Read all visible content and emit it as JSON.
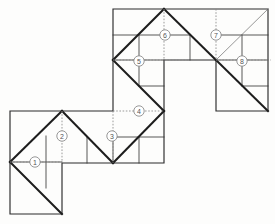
{
  "diagram": {
    "canvas": {
      "width": 275,
      "height": 224
    },
    "background_color": "#fdfdfc",
    "line_colors": {
      "outline": "#2b2b2b",
      "bold_diagonal": "#1d1d1d",
      "thin_grid": "#3a3a3a",
      "hairline": "#6a6a6a",
      "construction_dotted": "#8a8a8a",
      "marker_stroke": "#7d7d7d",
      "marker_text": "#555555"
    },
    "markers": [
      {
        "id": "1",
        "label": "1",
        "x": 35,
        "y": 162
      },
      {
        "id": "2",
        "label": "2",
        "x": 62,
        "y": 136
      },
      {
        "id": "3",
        "label": "3",
        "x": 112,
        "y": 136
      },
      {
        "id": "4",
        "label": "4",
        "x": 139,
        "y": 111
      },
      {
        "id": "5",
        "label": "5",
        "x": 139,
        "y": 61
      },
      {
        "id": "6",
        "label": "6",
        "x": 165,
        "y": 35
      },
      {
        "id": "7",
        "label": "7",
        "x": 216,
        "y": 35
      },
      {
        "id": "8",
        "label": "8",
        "x": 242,
        "y": 61
      }
    ],
    "outline_path": "M113,9 L268,9 L268,111 L216,111 L216,60 L164,60 L164,163 L62,163 L62,214 L10,214 L10,111 L113,111 Z",
    "bold_lines": [
      {
        "name": "lower-left-upper-diagonal",
        "x1": 10,
        "y1": 162,
        "x2": 62,
        "y2": 111
      },
      {
        "name": "lower-left-lower-diagonal",
        "x1": 10,
        "y1": 162,
        "x2": 62,
        "y2": 214
      },
      {
        "name": "lower-mid-left-diagonal",
        "x1": 62,
        "y1": 111,
        "x2": 113,
        "y2": 163
      },
      {
        "name": "lower-mid-right-diagonal",
        "x1": 113,
        "y1": 163,
        "x2": 164,
        "y2": 111
      },
      {
        "name": "mid-rise-diagonal",
        "x1": 113,
        "y1": 163,
        "x2": 164,
        "y2": 111
      },
      {
        "name": "column-diagonal-lower",
        "x1": 113,
        "y1": 60,
        "x2": 164,
        "y2": 111
      },
      {
        "name": "column-diagonal-upper",
        "x1": 113,
        "y1": 60,
        "x2": 164,
        "y2": 9
      },
      {
        "name": "upper-apex-right",
        "x1": 164,
        "y1": 9,
        "x2": 216,
        "y2": 60
      },
      {
        "name": "upper-right-descend",
        "x1": 216,
        "y1": 60,
        "x2": 268,
        "y2": 111
      }
    ],
    "hairlines": [
      {
        "name": "right-block-up-diagonal",
        "x1": 216,
        "y1": 60,
        "x2": 268,
        "y2": 9
      }
    ],
    "thin_lines": [
      {
        "name": "ll-vertical-stub",
        "x1": 46,
        "y1": 136,
        "x2": 46,
        "y2": 188
      },
      {
        "name": "ll-midline",
        "x1": 10,
        "y1": 162,
        "x2": 62,
        "y2": 162
      },
      {
        "name": "lm-vertical-a",
        "x1": 87,
        "y1": 137,
        "x2": 87,
        "y2": 163
      },
      {
        "name": "lm-vertical-b",
        "x1": 113,
        "y1": 137,
        "x2": 113,
        "y2": 163
      },
      {
        "name": "lm-horizontal",
        "x1": 113,
        "y1": 137,
        "x2": 164,
        "y2": 137
      },
      {
        "name": "lm-vertical-c",
        "x1": 139,
        "y1": 137,
        "x2": 139,
        "y2": 163
      },
      {
        "name": "col-horizontal-top",
        "x1": 113,
        "y1": 35,
        "x2": 190,
        "y2": 35
      },
      {
        "name": "col-vertical-left",
        "x1": 139,
        "y1": 35,
        "x2": 139,
        "y2": 86
      },
      {
        "name": "col-vertical-right",
        "x1": 190,
        "y1": 35,
        "x2": 190,
        "y2": 60
      },
      {
        "name": "col-horizontal-mid",
        "x1": 113,
        "y1": 60,
        "x2": 164,
        "y2": 60
      },
      {
        "name": "col-horizontal-lower",
        "x1": 139,
        "y1": 86,
        "x2": 164,
        "y2": 86
      },
      {
        "name": "rb-horizontal-top",
        "x1": 216,
        "y1": 35,
        "x2": 268,
        "y2": 35
      },
      {
        "name": "rb-vertical-a",
        "x1": 242,
        "y1": 35,
        "x2": 242,
        "y2": 86
      },
      {
        "name": "rb-horizontal-mid",
        "x1": 216,
        "y1": 60,
        "x2": 268,
        "y2": 60
      },
      {
        "name": "rb-horizontal-low",
        "x1": 242,
        "y1": 86,
        "x2": 268,
        "y2": 86
      }
    ],
    "dotted_lines": [
      {
        "name": "axis-1-horizontal",
        "x1": 10,
        "y1": 162,
        "x2": 62,
        "y2": 162
      },
      {
        "name": "axis-2-vertical",
        "x1": 62,
        "y1": 111,
        "x2": 62,
        "y2": 163
      },
      {
        "name": "axis-3-vertical",
        "x1": 113,
        "y1": 111,
        "x2": 113,
        "y2": 163
      },
      {
        "name": "axis-4-horizontal",
        "x1": 113,
        "y1": 111,
        "x2": 164,
        "y2": 111
      },
      {
        "name": "axis-5-horizontal",
        "x1": 113,
        "y1": 60,
        "x2": 190,
        "y2": 60
      },
      {
        "name": "axis-6-vertical",
        "x1": 164,
        "y1": 9,
        "x2": 164,
        "y2": 60
      },
      {
        "name": "axis-7-vertical",
        "x1": 216,
        "y1": 9,
        "x2": 216,
        "y2": 60
      },
      {
        "name": "axis-8-horizontal",
        "x1": 216,
        "y1": 60,
        "x2": 271,
        "y2": 60
      }
    ]
  }
}
